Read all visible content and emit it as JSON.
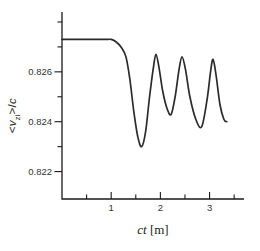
{
  "figure": {
    "background": "#ffffff",
    "curve_color": "#2b2b2b",
    "axis_color": "#1a1a1a",
    "tick_label_color": "#333333"
  },
  "chart_data": {
    "type": "line",
    "title": "",
    "xlabel": {
      "var": "ct",
      "unit": " [m]"
    },
    "ylabel": {
      "lt": "<",
      "var": "v",
      "sub": "zi",
      "gt": ">",
      "slash": "/",
      "denom": "c"
    },
    "xlim": [
      0,
      3.7
    ],
    "ylim": [
      0.8209,
      0.8284
    ],
    "grid": false,
    "legend": null,
    "x_ticks_major": [
      1,
      2,
      3
    ],
    "x_tick_labels": [
      "1",
      "2",
      "3"
    ],
    "x_ticks_minor": [
      0.5,
      1.5,
      2.5,
      3.5
    ],
    "y_ticks_major": [
      0.822,
      0.824,
      0.826
    ],
    "y_tick_labels": [
      "0.822",
      "0.824",
      "0.826"
    ],
    "y_ticks_minor": [
      0.823,
      0.825,
      0.827,
      0.828
    ],
    "series": [
      {
        "x": [
          0,
          0.8,
          1.0,
          1.1,
          1.2,
          1.3,
          1.38,
          1.46,
          1.54,
          1.62,
          1.7,
          1.78,
          1.86,
          1.91,
          1.97,
          2.05,
          2.14,
          2.22,
          2.3,
          2.38,
          2.44,
          2.51,
          2.6,
          2.72,
          2.84,
          2.95,
          3.02,
          3.07,
          3.13,
          3.21,
          3.29,
          3.35
        ],
        "y": [
          0.8273,
          0.8273,
          0.8273,
          0.8272,
          0.827,
          0.8266,
          0.8257,
          0.8244,
          0.8234,
          0.823,
          0.8236,
          0.825,
          0.8262,
          0.8267,
          0.8262,
          0.8252,
          0.8245,
          0.8243,
          0.825,
          0.8261,
          0.8266,
          0.8261,
          0.825,
          0.8241,
          0.8238,
          0.8249,
          0.826,
          0.8265,
          0.8259,
          0.8247,
          0.8241,
          0.824
        ]
      }
    ],
    "features": {
      "flat_start_value": 0.8273,
      "first_minimum": {
        "x": 1.62,
        "y": 0.823
      },
      "peaks": [
        {
          "x": 1.91,
          "y": 0.8267
        },
        {
          "x": 2.44,
          "y": 0.8266
        },
        {
          "x": 3.07,
          "y": 0.8265
        }
      ],
      "later_minima": [
        {
          "x": 2.22,
          "y": 0.8243
        },
        {
          "x": 2.84,
          "y": 0.8238
        }
      ]
    }
  }
}
